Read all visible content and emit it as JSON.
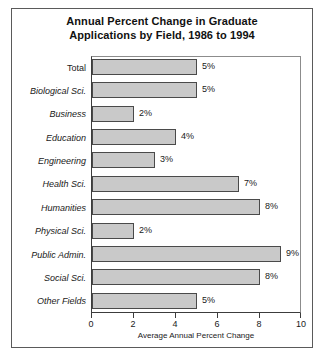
{
  "figure": {
    "title_line_1": "Annual Percent Change in Graduate",
    "title_line_2": "Applications by Field, 1986 to 1994",
    "frame_color": "#5a5a5a",
    "bar_fill_color": "#c9c9c9",
    "bar_border_color": "#4a4a4a"
  },
  "chart_data": {
    "type": "bar",
    "orientation": "horizontal",
    "title": "Annual Percent Change in Graduate Applications by Field, 1986 to 1994",
    "xlabel": "Average Annual Percent Change",
    "ylabel": "",
    "xlim": [
      0,
      10
    ],
    "xticks": [
      0,
      2,
      4,
      6,
      8,
      10
    ],
    "xtick_labels": [
      "0",
      "2",
      "4",
      "6",
      "8",
      "10"
    ],
    "grid": false,
    "legend": false,
    "value_label_suffix": "%",
    "categories": [
      "Total",
      "Biological Sci.",
      "Business",
      "Education",
      "Engineering",
      "Health Sci.",
      "Humanities",
      "Physical Sci.",
      "Public Admin.",
      "Social Sci.",
      "Other Fields"
    ],
    "values": [
      5,
      5,
      2,
      4,
      3,
      7,
      8,
      2,
      9,
      8,
      5
    ],
    "value_labels": [
      "5%",
      "5%",
      "2%",
      "4%",
      "3%",
      "7%",
      "8%",
      "2%",
      "9%",
      "8%",
      "5%"
    ],
    "bars": [
      {
        "category": "Total",
        "value": 5,
        "label": "5%",
        "italic": false
      },
      {
        "category": "Biological Sci.",
        "value": 5,
        "label": "5%",
        "italic": true
      },
      {
        "category": "Business",
        "value": 2,
        "label": "2%",
        "italic": true
      },
      {
        "category": "Education",
        "value": 4,
        "label": "4%",
        "italic": true
      },
      {
        "category": "Engineering",
        "value": 3,
        "label": "3%",
        "italic": true
      },
      {
        "category": "Health Sci.",
        "value": 7,
        "label": "7%",
        "italic": true
      },
      {
        "category": "Humanities",
        "value": 8,
        "label": "8%",
        "italic": true
      },
      {
        "category": "Physical Sci.",
        "value": 2,
        "label": "2%",
        "italic": true
      },
      {
        "category": "Public Admin.",
        "value": 9,
        "label": "9%",
        "italic": true
      },
      {
        "category": "Social Sci.",
        "value": 8,
        "label": "8%",
        "italic": true
      },
      {
        "category": "Other Fields",
        "value": 5,
        "label": "5%",
        "italic": true
      }
    ]
  }
}
